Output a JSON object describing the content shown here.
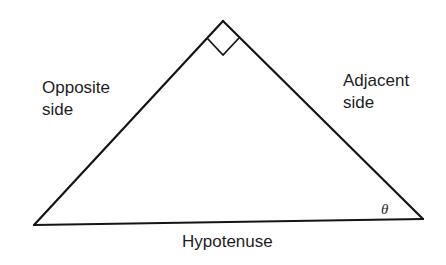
{
  "diagram": {
    "type": "right-triangle",
    "right_angle_marker": true,
    "labels": {
      "opposite": [
        "Opposite",
        "side"
      ],
      "adjacent": [
        "Adjacent",
        "side"
      ],
      "hypotenuse": "Hypotenuse",
      "angle": "θ"
    },
    "colors": {
      "stroke": "#151515",
      "text": "#1e1e1e",
      "background": "#ffffff"
    }
  }
}
